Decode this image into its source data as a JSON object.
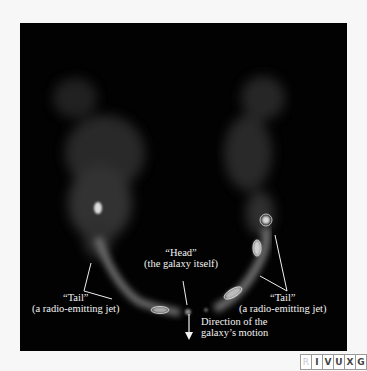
{
  "figure": {
    "labels": {
      "head_title": "“Head”",
      "head_sub": "(the galaxy itself)",
      "tail_left_title": "“Tail”",
      "tail_left_sub": "(a radio-emitting jet)",
      "tail_right_title": "“Tail”",
      "tail_right_sub": "(a radio-emitting jet)",
      "motion_line1": "Direction of the",
      "motion_line2": "galaxy’s motion"
    },
    "arrow_icon": "down-arrow-icon"
  },
  "spectrum_badge": {
    "bands": [
      {
        "letter": "R",
        "active": false
      },
      {
        "letter": "I",
        "active": true
      },
      {
        "letter": "V",
        "active": true
      },
      {
        "letter": "U",
        "active": true
      },
      {
        "letter": "X",
        "active": true
      },
      {
        "letter": "G",
        "active": true
      }
    ]
  }
}
